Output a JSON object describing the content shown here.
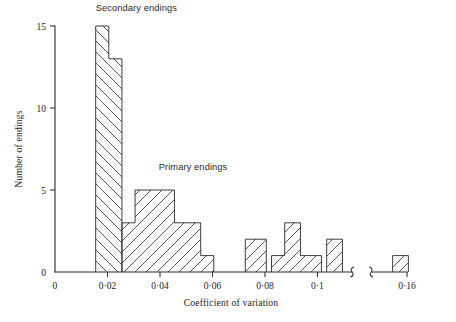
{
  "chart_data": {
    "type": "bar",
    "title": "",
    "subtitle": "",
    "xlabel": "Coefficient of variation",
    "ylabel": "Number of endings",
    "xlim": [
      0,
      0.16
    ],
    "ylim": [
      0,
      15
    ],
    "grid": false,
    "legend_position": "inline-annotation",
    "x_ticks": [
      {
        "value": 0,
        "label": "0"
      },
      {
        "value": 0.02,
        "label": "0·02"
      },
      {
        "value": 0.04,
        "label": "0·04"
      },
      {
        "value": 0.06,
        "label": "0·06"
      },
      {
        "value": 0.08,
        "label": "0·08"
      },
      {
        "value": 0.1,
        "label": "0·1"
      },
      {
        "value": 0.16,
        "label": "0·16"
      }
    ],
    "y_ticks": [
      {
        "value": 0,
        "label": "0"
      },
      {
        "value": 5,
        "label": "5"
      },
      {
        "value": 10,
        "label": "10"
      },
      {
        "value": 15,
        "label": "15"
      }
    ],
    "axis_break": {
      "present": true,
      "from": 0.113,
      "to": 0.1465
    },
    "annotations": [
      {
        "text": "Secondary endings",
        "x": 0.0155,
        "y": 15.9
      },
      {
        "text": "Primary endings",
        "x": 0.0395,
        "y": 6.2
      }
    ],
    "series": [
      {
        "name": "Secondary endings",
        "hatch": "backslash",
        "bins": [
          {
            "x0": 0.0155,
            "x1": 0.0205,
            "value": 15
          },
          {
            "x0": 0.0205,
            "x1": 0.0255,
            "value": 13
          }
        ]
      },
      {
        "name": "Primary endings",
        "hatch": "forwardslash",
        "bins": [
          {
            "x0": 0.0255,
            "x1": 0.0305,
            "value": 3
          },
          {
            "x0": 0.0305,
            "x1": 0.0455,
            "value": 5
          },
          {
            "x0": 0.0455,
            "x1": 0.0555,
            "value": 3
          },
          {
            "x0": 0.0555,
            "x1": 0.0605,
            "value": 1
          },
          {
            "x0": 0.0725,
            "x1": 0.0805,
            "value": 2
          },
          {
            "x0": 0.0825,
            "x1": 0.0875,
            "value": 1
          },
          {
            "x0": 0.0875,
            "x1": 0.0935,
            "value": 3
          },
          {
            "x0": 0.0935,
            "x1": 0.1015,
            "value": 1
          },
          {
            "x0": 0.1035,
            "x1": 0.1095,
            "value": 2
          },
          {
            "x0": 0.1545,
            "x1": 0.1605,
            "value": 1
          }
        ]
      }
    ]
  },
  "figure": {
    "caption": ""
  }
}
